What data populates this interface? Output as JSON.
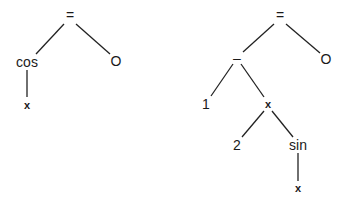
{
  "trees": [
    {
      "name": "cos(x) = 0",
      "nodes": [
        {
          "id": "eq",
          "label": "=",
          "x": 70,
          "y": 16
        },
        {
          "id": "cos",
          "label": "cos",
          "x": 27,
          "y": 62
        },
        {
          "id": "zero",
          "label": "O",
          "x": 116,
          "y": 61
        },
        {
          "id": "x",
          "label": "x",
          "x": 27,
          "y": 105
        }
      ],
      "edges": [
        [
          "eq",
          "cos"
        ],
        [
          "eq",
          "zero"
        ],
        [
          "cos",
          "x"
        ]
      ]
    },
    {
      "name": "1 - 2 x sin(x) = 0",
      "nodes": [
        {
          "id": "eq",
          "label": "=",
          "x": 280,
          "y": 16
        },
        {
          "id": "minus",
          "label": "–",
          "x": 237,
          "y": 58
        },
        {
          "id": "zero",
          "label": "O",
          "x": 326,
          "y": 59
        },
        {
          "id": "one",
          "label": "1",
          "x": 206,
          "y": 104
        },
        {
          "id": "times",
          "label": "x",
          "x": 268,
          "y": 104
        },
        {
          "id": "two",
          "label": "2",
          "x": 237,
          "y": 145
        },
        {
          "id": "sin",
          "label": "sin",
          "x": 298,
          "y": 145
        },
        {
          "id": "x",
          "label": "x",
          "x": 298,
          "y": 188
        }
      ],
      "edges": [
        [
          "eq",
          "minus"
        ],
        [
          "eq",
          "zero"
        ],
        [
          "minus",
          "one"
        ],
        [
          "minus",
          "times"
        ],
        [
          "times",
          "two"
        ],
        [
          "times",
          "sin"
        ],
        [
          "sin",
          "x"
        ]
      ]
    }
  ],
  "labels": {
    "t0": {
      "eq": "=",
      "cos": "cos",
      "zero": "O",
      "x": "x"
    },
    "t1": {
      "eq": "=",
      "minus": "–",
      "zero": "O",
      "one": "1",
      "times": "x",
      "two": "2",
      "sin": "sin",
      "x": "x"
    }
  }
}
